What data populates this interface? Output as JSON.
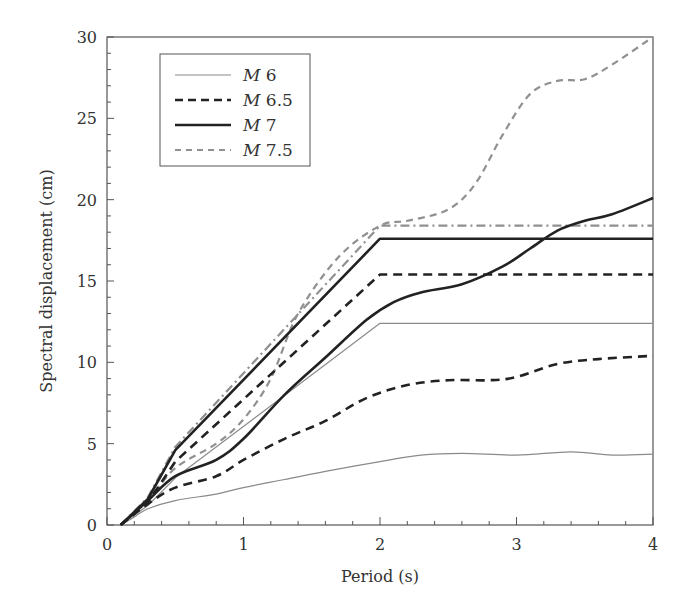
{
  "chart_data": {
    "type": "line",
    "title": "",
    "xlabel": "Period (s)",
    "ylabel": "Spectral displacement (cm)",
    "xlim": [
      0,
      4
    ],
    "ylim": [
      0,
      30
    ],
    "xticks": [
      0,
      1,
      2,
      3,
      4
    ],
    "yticks": [
      0,
      5,
      10,
      15,
      20,
      25,
      30
    ],
    "grid": false,
    "legend_position": "upper left",
    "legend": [
      {
        "label_italic": "M",
        "label_num": "6",
        "style": "thin-solid-gray"
      },
      {
        "label_italic": "M",
        "label_num": "6.5",
        "style": "thick-dashed-black"
      },
      {
        "label_italic": "M",
        "label_num": "7",
        "style": "thick-solid-black"
      },
      {
        "label_italic": "M",
        "label_num": "7.5",
        "style": "dashed-gray"
      }
    ],
    "series": [
      {
        "name": "M 6 (design spectrum)",
        "magnitude": "6",
        "kind": "design",
        "color": "#8a8a8a",
        "width": 1.2,
        "dash": "",
        "x": [
          0.1,
          0.3,
          0.5,
          2.0,
          4.0
        ],
        "y": [
          0,
          1.2,
          2.9,
          12.4,
          12.4
        ]
      },
      {
        "name": "M 6 (mean spectrum)",
        "magnitude": "6",
        "kind": "mean",
        "color": "#8a8a8a",
        "width": 1.2,
        "dash": "",
        "x": [
          0.1,
          0.2,
          0.3,
          0.5,
          0.8,
          1.0,
          1.3,
          1.6,
          2.0,
          2.3,
          2.6,
          3.0,
          3.4,
          3.7,
          4.0
        ],
        "y": [
          0,
          0.5,
          1.0,
          1.5,
          1.9,
          2.3,
          2.8,
          3.3,
          3.9,
          4.3,
          4.4,
          4.3,
          4.5,
          4.3,
          4.35
        ]
      },
      {
        "name": "M 6.5 (design spectrum)",
        "magnitude": "6.5",
        "kind": "design",
        "color": "#222222",
        "width": 2.6,
        "dash": "9,6",
        "x": [
          0.1,
          0.3,
          0.5,
          2.0,
          4.0
        ],
        "y": [
          0,
          1.4,
          3.9,
          15.4,
          15.4
        ]
      },
      {
        "name": "M 6.5 (mean spectrum)",
        "magnitude": "6.5",
        "kind": "mean",
        "color": "#222222",
        "width": 2.6,
        "dash": "9,6",
        "x": [
          0.1,
          0.3,
          0.5,
          0.8,
          1.0,
          1.3,
          1.6,
          1.9,
          2.2,
          2.5,
          2.8,
          3.0,
          3.3,
          3.6,
          4.0
        ],
        "y": [
          0,
          1.3,
          2.3,
          3.0,
          4.0,
          5.3,
          6.4,
          7.8,
          8.6,
          8.9,
          8.9,
          9.1,
          9.9,
          10.2,
          10.4
        ]
      },
      {
        "name": "M 7 (design spectrum)",
        "magnitude": "7",
        "kind": "design",
        "color": "#222222",
        "width": 2.6,
        "dash": "",
        "x": [
          0.1,
          0.3,
          0.5,
          2.0,
          4.0
        ],
        "y": [
          0,
          1.6,
          4.6,
          17.6,
          17.6
        ]
      },
      {
        "name": "M 7 (mean spectrum)",
        "magnitude": "7",
        "kind": "mean",
        "color": "#222222",
        "width": 2.6,
        "dash": "",
        "x": [
          0.1,
          0.3,
          0.5,
          0.8,
          1.0,
          1.3,
          1.6,
          1.9,
          2.1,
          2.3,
          2.6,
          2.9,
          3.1,
          3.3,
          3.5,
          3.7,
          4.0
        ],
        "y": [
          0,
          1.5,
          3.0,
          4.0,
          5.3,
          8.0,
          10.3,
          12.6,
          13.7,
          14.3,
          14.8,
          15.9,
          17.0,
          18.1,
          18.7,
          19.1,
          20.1
        ]
      },
      {
        "name": "M 7.5 (design spectrum)",
        "magnitude": "7.5",
        "kind": "design",
        "color": "#909090",
        "width": 2.2,
        "dash": "9,4,2,4",
        "x": [
          0.1,
          0.3,
          0.5,
          2.0,
          4.0
        ],
        "y": [
          0,
          1.7,
          4.8,
          18.4,
          18.4
        ]
      },
      {
        "name": "M 7.5 (mean spectrum)",
        "magnitude": "7.5",
        "kind": "mean",
        "color": "#909090",
        "width": 2.2,
        "dash": "7,5",
        "x": [
          0.1,
          0.3,
          0.5,
          0.8,
          1.0,
          1.2,
          1.4,
          1.7,
          2.0,
          2.2,
          2.5,
          2.7,
          2.9,
          3.1,
          3.3,
          3.5,
          3.7,
          4.0
        ],
        "y": [
          0,
          1.5,
          3.5,
          5.0,
          6.5,
          9.0,
          13.0,
          16.5,
          18.4,
          18.7,
          19.4,
          21.0,
          24.0,
          26.5,
          27.3,
          27.4,
          28.3,
          30.0
        ]
      }
    ]
  }
}
